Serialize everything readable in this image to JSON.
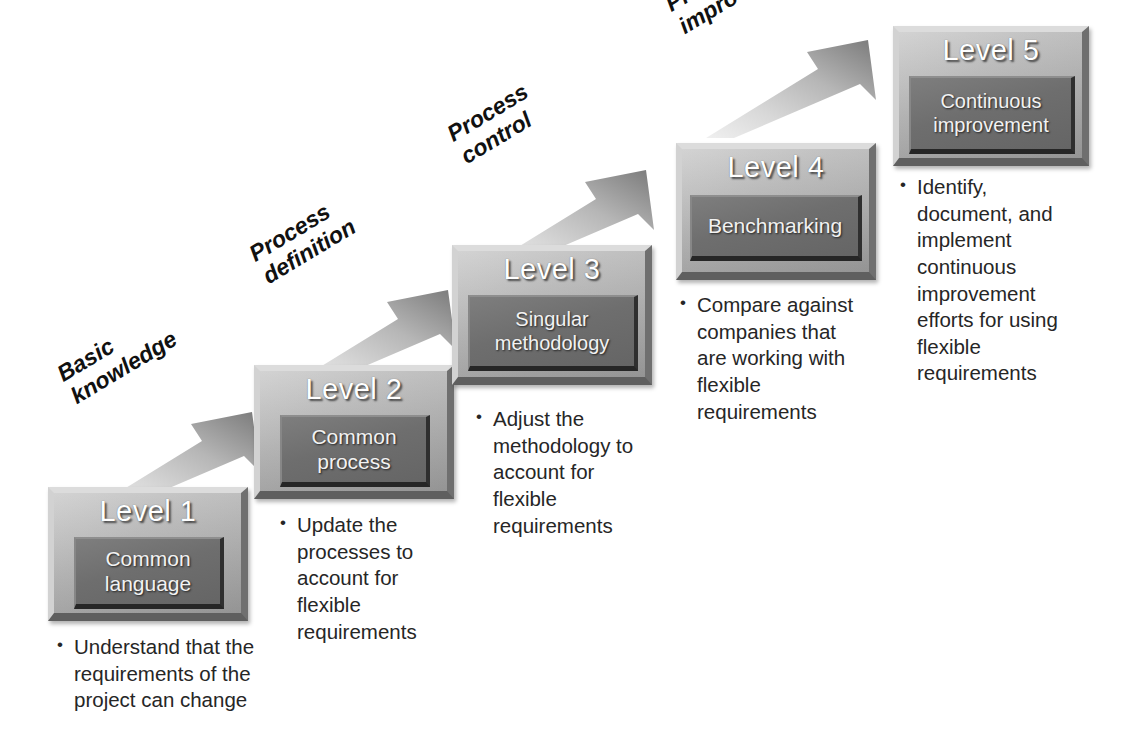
{
  "diagram": {
    "type": "staircase-maturity-model",
    "background_color": "#ffffff",
    "accent_colors": {
      "plate_light": "#c9c9c9",
      "plate_dark": "#9c9c9c",
      "inner_box": "#6e6e6e",
      "arrow_light": "#e2e2e2",
      "arrow_dark": "#7b7b7b",
      "text_dark": "#262626",
      "text_light": "#ffffff"
    }
  },
  "levels": [
    {
      "title": "Level 1",
      "inner_line_1": "Common",
      "inner_line_2": "language",
      "bullets": [
        "Understand that the requirements of the project can change"
      ]
    },
    {
      "title": "Level 2",
      "inner_line_1": "Common",
      "inner_line_2": "process",
      "bullets": [
        "Update the processes to account for flexible requirements"
      ]
    },
    {
      "title": "Level 3",
      "inner_line_1": "Singular",
      "inner_line_2": "methodology",
      "bullets": [
        "Adjust the methodology to account for flexible requirements"
      ]
    },
    {
      "title": "Level 4",
      "inner_line_1": "Benchmarking",
      "inner_line_2": "",
      "bullets": [
        "Compare against companies that are working with flexible requirements"
      ]
    },
    {
      "title": "Level 5",
      "inner_line_1": "Continuous",
      "inner_line_2": "improvement",
      "bullets": [
        "Identify, document, and implement continuous improvement efforts for using flexible requirements"
      ]
    }
  ],
  "arrows": [
    {
      "label_line_1": "Basic",
      "label_line_2": "knowledge",
      "from": "Level 1",
      "to": "Level 2"
    },
    {
      "label_line_1": "Process",
      "label_line_2": "definition",
      "from": "Level 2",
      "to": "Level 3"
    },
    {
      "label_line_1": "Process",
      "label_line_2": "control",
      "from": "Level 3",
      "to": "Level 4"
    },
    {
      "label_line_1": "Process",
      "label_line_2": "improvement",
      "from": "Level 4",
      "to": "Level 5"
    }
  ]
}
